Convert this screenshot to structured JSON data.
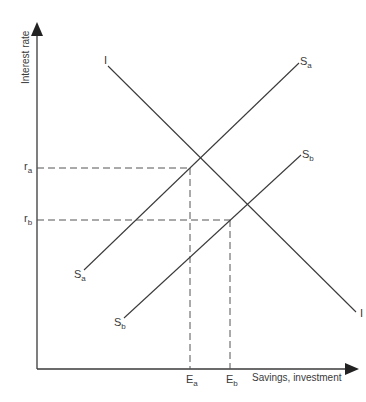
{
  "diagram": {
    "type": "savings-investment",
    "y_axis_label": "Interest rate",
    "x_axis_label": "Savings, investment",
    "curves": [
      {
        "id": "I",
        "label_start": "I",
        "label_end": "I",
        "description": "Investment demand (downward sloping)"
      },
      {
        "id": "Sa",
        "label": "S",
        "subscript": "a",
        "description": "Savings supply a"
      },
      {
        "id": "Sb",
        "label": "S",
        "subscript": "b",
        "description": "Savings supply b (shifted right)"
      }
    ],
    "equilibria": [
      {
        "rate_label": "r",
        "rate_sub": "a",
        "quantity_label": "E",
        "quantity_sub": "a"
      },
      {
        "rate_label": "r",
        "rate_sub": "b",
        "quantity_label": "E",
        "quantity_sub": "b"
      }
    ],
    "colors": {
      "line": "#3a3a3a",
      "dashed": "#555555"
    }
  },
  "labels": {
    "I_top": "I",
    "I_bottom": "I",
    "Sa_top": "S",
    "Sa_top_sub": "a",
    "Sa_bottom": "S",
    "Sa_bottom_sub": "a",
    "Sb_top": "S",
    "Sb_top_sub": "b",
    "Sb_bottom": "S",
    "Sb_bottom_sub": "b",
    "ra": "r",
    "ra_sub": "a",
    "rb": "r",
    "rb_sub": "b",
    "Ea": "E",
    "Ea_sub": "a",
    "Eb": "E",
    "Eb_sub": "b",
    "y_axis": "Interest rate",
    "x_axis": "Savings, investment"
  }
}
